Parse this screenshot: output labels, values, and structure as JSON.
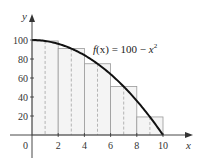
{
  "chart_data": {
    "type": "area",
    "title": "",
    "annotation": "f(x) = 100 − x²",
    "annotation_parts": {
      "f": "f",
      "x_arg": "(x)",
      "eq": " = 100 − ",
      "x": "x",
      "exp": "2"
    },
    "xlabel": "x",
    "ylabel": "y",
    "xlim": [
      0,
      10
    ],
    "ylim": [
      0,
      100
    ],
    "x_ticks": [
      2,
      4,
      6,
      8,
      10
    ],
    "y_ticks": [
      20,
      40,
      60,
      80,
      100
    ],
    "origin_label": "0",
    "grid": false,
    "legend": null,
    "curve": {
      "name": "f(x) = 100 - x^2",
      "x": [
        0,
        1,
        2,
        3,
        4,
        5,
        6,
        7,
        8,
        9,
        10
      ],
      "y": [
        100,
        99,
        96,
        91,
        84,
        75,
        64,
        51,
        36,
        19,
        0
      ]
    },
    "rectangles": {
      "method": "midpoint",
      "width": 2,
      "left_edges": [
        0,
        2,
        4,
        6,
        8
      ],
      "midpoints": [
        1,
        3,
        5,
        7,
        9
      ],
      "heights": [
        99,
        91,
        75,
        51,
        19
      ]
    }
  },
  "colors": {
    "curve": "#111111",
    "rect_stroke": "#9a9a9a",
    "rect_fill": "#f4f4f4",
    "midpoint_dash": "#999999",
    "axis": "#333333"
  }
}
